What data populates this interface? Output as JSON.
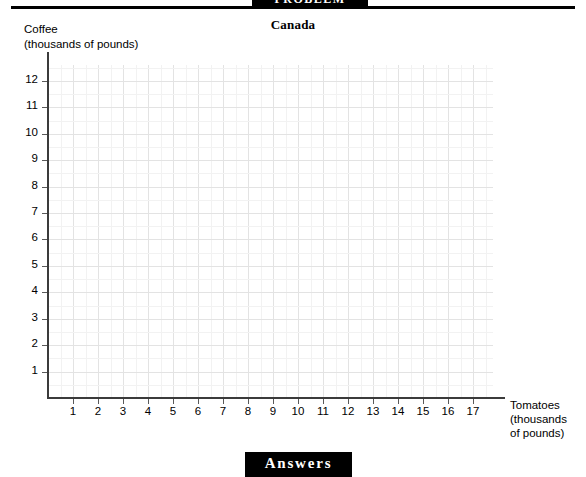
{
  "page": {
    "section_header": "PROBLEM",
    "footer_label": "Answers"
  },
  "chart_data": {
    "type": "scatter",
    "title": "Canada",
    "xlabel": "Tomatoes",
    "xlabel_units": "(thousands",
    "xlabel_units2": "of pounds)",
    "ylabel": "Coffee",
    "ylabel_units": "(thousands of pounds)",
    "xlim": [
      0,
      17.8
    ],
    "ylim": [
      0,
      12.6
    ],
    "xticks": [
      1,
      2,
      3,
      4,
      5,
      6,
      7,
      8,
      9,
      10,
      11,
      12,
      13,
      14,
      15,
      16,
      17
    ],
    "yticks": [
      1,
      2,
      3,
      4,
      5,
      6,
      7,
      8,
      9,
      10,
      11,
      12
    ],
    "x": [],
    "y": [],
    "series": [],
    "grid": true,
    "minor_grid": true,
    "minor_divisions": 2,
    "legend": false,
    "annotations": [],
    "note": "empty coordinate grid, no data plotted"
  },
  "colors": {
    "axis": "#3b3b3b",
    "gridline_major": "#e3e3e3",
    "gridline_minor": "#f2f2f2",
    "header_box": "#000000",
    "header_text": "#ffffff",
    "text": "#000000"
  }
}
